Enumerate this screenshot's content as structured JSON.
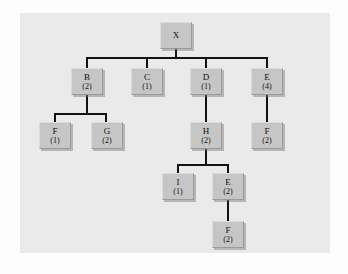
{
  "figure": {
    "kind": "tree-diagram",
    "panel_background": "#eaeaea",
    "node_fill": "#c6c6c6",
    "edge_color": "#121212",
    "text_color": "#101010"
  },
  "nodes": [
    {
      "id": "x",
      "label": "X",
      "count": "",
      "x": 160,
      "y": 22,
      "level": 0
    },
    {
      "id": "b",
      "label": "B",
      "count": "(2)",
      "x": 71,
      "y": 68,
      "level": 1
    },
    {
      "id": "c",
      "label": "C",
      "count": "(1)",
      "x": 131,
      "y": 68,
      "level": 1
    },
    {
      "id": "d",
      "label": "D",
      "count": "(1)",
      "x": 190,
      "y": 68,
      "level": 1
    },
    {
      "id": "e4",
      "label": "E",
      "count": "(4)",
      "x": 251,
      "y": 68,
      "level": 1
    },
    {
      "id": "f1",
      "label": "F",
      "count": "(1)",
      "x": 39,
      "y": 122,
      "level": 2
    },
    {
      "id": "g2",
      "label": "G",
      "count": "(2)",
      "x": 91,
      "y": 122,
      "level": 2
    },
    {
      "id": "h2",
      "label": "H",
      "count": "(2)",
      "x": 190,
      "y": 122,
      "level": 2
    },
    {
      "id": "f2r",
      "label": "F",
      "count": "(2)",
      "x": 251,
      "y": 122,
      "level": 2
    },
    {
      "id": "i1",
      "label": "I",
      "count": "(1)",
      "x": 162,
      "y": 173,
      "level": 3
    },
    {
      "id": "e2",
      "label": "E",
      "count": "(2)",
      "x": 212,
      "y": 173,
      "level": 3
    },
    {
      "id": "f2b",
      "label": "F",
      "count": "(2)",
      "x": 212,
      "y": 221,
      "level": 4
    }
  ],
  "edges": [
    {
      "from": "x",
      "to": "b",
      "name": "edge-x-b"
    },
    {
      "from": "x",
      "to": "c",
      "name": "edge-x-c"
    },
    {
      "from": "x",
      "to": "d",
      "name": "edge-x-d"
    },
    {
      "from": "x",
      "to": "e4",
      "name": "edge-x-e"
    },
    {
      "from": "b",
      "to": "f1",
      "name": "edge-b-f"
    },
    {
      "from": "b",
      "to": "g2",
      "name": "edge-b-g"
    },
    {
      "from": "d",
      "to": "h2",
      "name": "edge-d-h"
    },
    {
      "from": "e4",
      "to": "f2r",
      "name": "edge-e-f"
    },
    {
      "from": "h2",
      "to": "i1",
      "name": "edge-h-i"
    },
    {
      "from": "h2",
      "to": "e2",
      "name": "edge-h-e"
    },
    {
      "from": "e2",
      "to": "f2b",
      "name": "edge-e-f-bottom"
    }
  ],
  "segments": [
    {
      "name": "stem-x-down",
      "type": "v",
      "x": 175,
      "y": 49,
      "len": 9
    },
    {
      "name": "bus-x-children",
      "type": "h",
      "x": 86,
      "y": 57,
      "len": 181
    },
    {
      "name": "drop-to-b",
      "type": "v",
      "x": 86,
      "y": 57,
      "len": 11
    },
    {
      "name": "drop-to-c",
      "type": "v",
      "x": 146,
      "y": 57,
      "len": 11
    },
    {
      "name": "drop-to-d",
      "type": "v",
      "x": 205,
      "y": 57,
      "len": 11
    },
    {
      "name": "drop-to-e4",
      "type": "v",
      "x": 266,
      "y": 57,
      "len": 11
    },
    {
      "name": "stem-b-down",
      "type": "v",
      "x": 86,
      "y": 95,
      "len": 19
    },
    {
      "name": "bus-b-children",
      "type": "h",
      "x": 54,
      "y": 113,
      "len": 53
    },
    {
      "name": "drop-to-f1",
      "type": "v",
      "x": 54,
      "y": 113,
      "len": 9
    },
    {
      "name": "drop-to-g2",
      "type": "v",
      "x": 105,
      "y": 113,
      "len": 9
    },
    {
      "name": "stem-d-to-h",
      "type": "v",
      "x": 205,
      "y": 95,
      "len": 27
    },
    {
      "name": "stem-e4-to-f2r",
      "type": "v",
      "x": 266,
      "y": 95,
      "len": 27
    },
    {
      "name": "stem-h-down",
      "type": "v",
      "x": 205,
      "y": 149,
      "len": 17
    },
    {
      "name": "bus-h-children",
      "type": "h",
      "x": 177,
      "y": 164,
      "len": 51
    },
    {
      "name": "drop-to-i1",
      "type": "v",
      "x": 177,
      "y": 164,
      "len": 9
    },
    {
      "name": "drop-to-e2",
      "type": "v",
      "x": 227,
      "y": 164,
      "len": 9
    },
    {
      "name": "stem-e2-to-f2b",
      "type": "v",
      "x": 227,
      "y": 200,
      "len": 21
    }
  ]
}
